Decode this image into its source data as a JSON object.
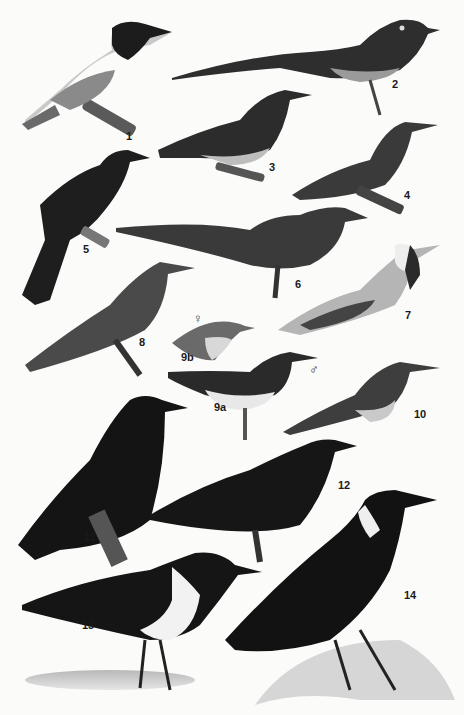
{
  "plate": {
    "description": "Illustrated plate of 14 perched birds, greyscale painting",
    "labels": [
      {
        "id": "1",
        "text": "1",
        "x": 126,
        "y": 131
      },
      {
        "id": "2",
        "text": "2",
        "x": 392,
        "y": 79
      },
      {
        "id": "3",
        "text": "3",
        "x": 269,
        "y": 162
      },
      {
        "id": "4",
        "text": "4",
        "x": 404,
        "y": 190
      },
      {
        "id": "5",
        "text": "5",
        "x": 83,
        "y": 244
      },
      {
        "id": "6",
        "text": "6",
        "x": 295,
        "y": 279
      },
      {
        "id": "7",
        "text": "7",
        "x": 405,
        "y": 310
      },
      {
        "id": "8",
        "text": "8",
        "x": 139,
        "y": 337
      },
      {
        "id": "9b",
        "text": "9b",
        "x": 181,
        "y": 352
      },
      {
        "id": "9a",
        "text": "9a",
        "x": 214,
        "y": 402
      },
      {
        "id": "10",
        "text": "10",
        "x": 414,
        "y": 409
      },
      {
        "id": "11",
        "text": "11",
        "x": 84,
        "y": 532
      },
      {
        "id": "12",
        "text": "12",
        "x": 338,
        "y": 480
      },
      {
        "id": "13",
        "text": "13",
        "x": 82,
        "y": 620
      },
      {
        "id": "14",
        "text": "14",
        "x": 404,
        "y": 590
      }
    ],
    "symbols": [
      {
        "id": "female",
        "text": "♀",
        "x": 193,
        "y": 312
      },
      {
        "id": "male",
        "text": "♂",
        "x": 309,
        "y": 363
      }
    ]
  }
}
